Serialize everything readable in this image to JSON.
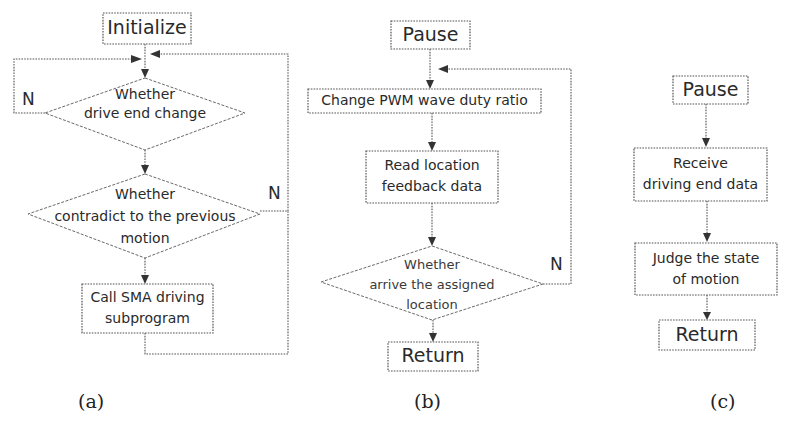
{
  "figure": {
    "panels": [
      {
        "id": "a",
        "caption": "(a)",
        "nodes": {
          "start": "Initialize",
          "decision1_line1": "Whether",
          "decision1_line2": "drive end change",
          "decision1_no": "N",
          "decision2_line1": "Whether",
          "decision2_line2": "contradict to the previous",
          "decision2_line3": "motion",
          "decision2_no": "N",
          "process_line1": "Call SMA driving",
          "process_line2": "subprogram"
        }
      },
      {
        "id": "b",
        "caption": "(b)",
        "nodes": {
          "start": "Pause",
          "process1": "Change PWM wave duty ratio",
          "process2_line1": "Read location",
          "process2_line2": "feedback data",
          "decision_line1": "Whether",
          "decision_line2": "arrive the assigned",
          "decision_line3": "location",
          "decision_no": "N",
          "end": "Return"
        }
      },
      {
        "id": "c",
        "caption": "(c)",
        "nodes": {
          "start": "Pause",
          "process1_line1": "Receive",
          "process1_line2": "driving end data",
          "process2_line1": "Judge the state",
          "process2_line2": "of motion",
          "end": "Return"
        }
      }
    ],
    "colors": {
      "background": "#ffffff",
      "stroke": "#555555",
      "text": "#2a2a2a"
    }
  }
}
